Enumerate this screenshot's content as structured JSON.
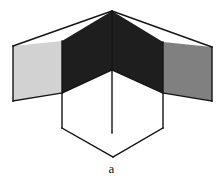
{
  "figure": {
    "caption": "a",
    "canvas": {
      "width": 223,
      "height": 190,
      "background": "#ffffff"
    },
    "stroke": {
      "color": "#141414",
      "width": 1.4,
      "join": "miter"
    },
    "palette": {
      "light_gray": "#d2d2d2",
      "medium_gray": "#808080",
      "dark": "#1e1e1e",
      "white": "#ffffff",
      "outline": "#141414"
    },
    "vertices": {
      "outer_top_apex": [
        112,
        11
      ],
      "outer_left_top": [
        13,
        46
      ],
      "outer_right_top": [
        212,
        47
      ],
      "outer_left_bottom": [
        13,
        101
      ],
      "outer_right_bottom": [
        212,
        101
      ],
      "center_junction": [
        112,
        70
      ],
      "inner_left_top": [
        62,
        41
      ],
      "inner_right_top": [
        163,
        42
      ],
      "inner_left_mid": [
        62,
        93
      ],
      "inner_right_mid": [
        163,
        93
      ],
      "inner_left_bottom": [
        62,
        128
      ],
      "inner_right_bottom": [
        163,
        128
      ],
      "cube_bottom_apex": [
        113,
        157
      ]
    },
    "faces": [
      {
        "name": "outer-left-face",
        "fill": "#d2d2d2",
        "points": "13,46 62,41 62,93 13,101"
      },
      {
        "name": "outer-right-face",
        "fill": "#808080",
        "points": "212,47 163,42 163,93 212,101"
      },
      {
        "name": "ceiling-left-face",
        "fill": "#1e1e1e",
        "points": "62,41 112,11 112,70 62,93"
      },
      {
        "name": "ceiling-right-face",
        "fill": "#1e1e1e",
        "points": "112,11 163,42 163,93 112,70"
      },
      {
        "name": "cube-left-face",
        "fill": "#ffffff",
        "points": "62,93 112,70 112,133 62,128"
      },
      {
        "name": "cube-right-face",
        "fill": "#ffffff",
        "points": "112,70 163,93 163,128 112,133"
      },
      {
        "name": "cube-bottom-left-face",
        "fill": "#ffffff",
        "points": "62,128 112,133 113,157"
      },
      {
        "name": "cube-bottom-right-face",
        "fill": "#ffffff",
        "points": "112,133 163,128 113,157"
      }
    ],
    "edges": [
      {
        "name": "outer-top-left-edge",
        "from": [
          13,
          46
        ],
        "to": [
          112,
          11
        ]
      },
      {
        "name": "outer-top-right-edge",
        "from": [
          112,
          11
        ],
        "to": [
          212,
          47
        ]
      },
      {
        "name": "outer-left-vertical-edge",
        "from": [
          13,
          46
        ],
        "to": [
          13,
          101
        ]
      },
      {
        "name": "outer-right-vertical-edge",
        "from": [
          212,
          47
        ],
        "to": [
          212,
          101
        ]
      },
      {
        "name": "outer-bottom-left-edge",
        "from": [
          13,
          101
        ],
        "to": [
          62,
          93
        ]
      },
      {
        "name": "outer-bottom-right-edge",
        "from": [
          212,
          101
        ],
        "to": [
          163,
          93
        ]
      },
      {
        "name": "seam-left-vertical",
        "from": [
          62,
          41
        ],
        "to": [
          62,
          128
        ]
      },
      {
        "name": "seam-right-vertical",
        "from": [
          163,
          42
        ],
        "to": [
          163,
          128
        ]
      },
      {
        "name": "center-vertical-edge",
        "from": [
          112,
          11
        ],
        "to": [
          112,
          133
        ]
      },
      {
        "name": "cube-top-left-edge",
        "from": [
          62,
          93
        ],
        "to": [
          112,
          70
        ]
      },
      {
        "name": "cube-top-right-edge",
        "from": [
          112,
          70
        ],
        "to": [
          163,
          93
        ]
      },
      {
        "name": "cube-bottom-left-edge",
        "from": [
          62,
          128
        ],
        "to": [
          113,
          157
        ]
      },
      {
        "name": "cube-bottom-right-edge",
        "from": [
          163,
          128
        ],
        "to": [
          113,
          157
        ]
      }
    ]
  }
}
